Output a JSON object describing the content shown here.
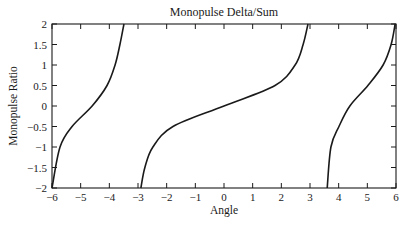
{
  "chart_data": {
    "type": "line",
    "title": "Monopulse Delta/Sum",
    "xlabel": "Angle",
    "ylabel": "Monopulse Ratio",
    "xlim": [
      -6,
      6
    ],
    "ylim": [
      -2,
      2
    ],
    "xticks": [
      -6,
      -5,
      -4,
      -3,
      -2,
      -1,
      0,
      1,
      2,
      3,
      4,
      5,
      6
    ],
    "xtick_labels": [
      "−6",
      "−5",
      "−4",
      "−3",
      "−2",
      "−1",
      "0",
      "1",
      "2",
      "3",
      "4",
      "5",
      "6"
    ],
    "yticks": [
      2,
      1.5,
      1,
      0.5,
      0,
      -0.5,
      -1,
      -1.5,
      -2
    ],
    "ytick_labels": [
      "2",
      "1.5",
      "1",
      "0.5",
      "0",
      "−0.5",
      "−1",
      "−1.5",
      "−2"
    ],
    "grid": false,
    "legend": null,
    "series": [
      {
        "name": "branch-left",
        "x": [
          -6.0,
          -5.72,
          -5.3,
          -4.6,
          -4.08,
          -3.8,
          -3.63,
          -3.49
        ],
        "y": [
          -2.0,
          -1.0,
          -0.5,
          0.0,
          0.5,
          1.0,
          1.5,
          2.0
        ]
      },
      {
        "name": "branch-center",
        "x": [
          -2.9,
          -2.76,
          -2.48,
          -1.78,
          0.0,
          1.78,
          2.48,
          2.76,
          2.93
        ],
        "y": [
          -2.0,
          -1.5,
          -1.0,
          -0.5,
          0.0,
          0.5,
          1.0,
          1.5,
          2.0
        ]
      },
      {
        "name": "branch-right",
        "x": [
          3.6,
          3.73,
          4.01,
          4.39,
          5.02,
          5.55,
          5.83,
          5.97
        ],
        "y": [
          -2.0,
          -1.0,
          -0.5,
          0.0,
          0.5,
          1.0,
          1.5,
          2.0
        ]
      }
    ],
    "line_color": "#1a1a1a"
  }
}
